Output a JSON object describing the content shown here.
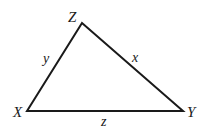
{
  "diagram": {
    "type": "triangle",
    "stroke_color": "#1a1a1a",
    "stroke_width": 2,
    "vertices": {
      "Z": {
        "label": "Z",
        "x": 82,
        "y": 23
      },
      "X": {
        "label": "X",
        "x": 27,
        "y": 111
      },
      "Y": {
        "label": "Y",
        "x": 183,
        "y": 111
      }
    },
    "sides": {
      "ZX": {
        "label": "y"
      },
      "ZY": {
        "label": "x"
      },
      "XY": {
        "label": "z"
      }
    }
  }
}
